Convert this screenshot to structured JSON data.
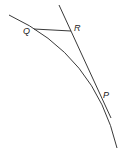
{
  "diagram": {
    "labels": {
      "Q": "Q",
      "R": "R",
      "P": "P"
    },
    "elements": [
      {
        "type": "curve",
        "name": "arc",
        "description": "circular arc through Q and P"
      },
      {
        "type": "line",
        "name": "tangent-line",
        "description": "tangent to the arc at P, passing through R"
      },
      {
        "type": "segment",
        "name": "segment-QR",
        "description": "horizontal segment from Q to R"
      }
    ],
    "colors": {
      "stroke": "#222222",
      "background": "#ffffff"
    }
  }
}
